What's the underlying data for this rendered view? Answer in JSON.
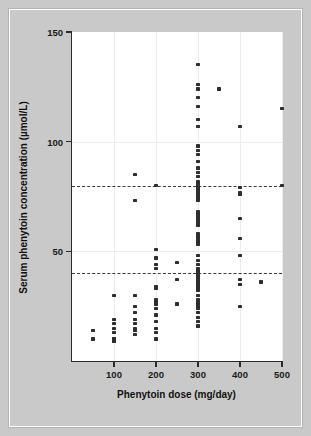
{
  "figure": {
    "background_color": "#c9c9c9",
    "panel_color": "#ffffff",
    "point_color": "#2e2e2e",
    "refline_color": "#3a3a3a",
    "axis_color": "#2b2b2b"
  },
  "chart_data": {
    "type": "scatter",
    "title": "",
    "xlabel": "Phenytoin dose (mg/day)",
    "ylabel": "Serum phenytoin concentration (µmol/L)",
    "xlim": [
      0,
      500
    ],
    "ylim": [
      0,
      150
    ],
    "xticks": [
      100,
      200,
      300,
      400,
      500
    ],
    "xticklabels": [
      "100",
      "200",
      "300",
      "400",
      "500"
    ],
    "yticks": [
      50,
      100,
      150
    ],
    "yticklabels": [
      "50",
      "100",
      "150"
    ],
    "grid": "faint-both",
    "legend": "none",
    "reference_lines": [
      {
        "axis": "y",
        "value": 80,
        "style": "dashed",
        "label": ""
      },
      {
        "axis": "y",
        "value": 40,
        "style": "dashed",
        "label": ""
      }
    ],
    "series": [
      {
        "name": "Patients",
        "marker": "square",
        "points": [
          [
            50,
            14
          ],
          [
            50,
            10
          ],
          [
            100,
            30
          ],
          [
            100,
            19
          ],
          [
            100,
            17
          ],
          [
            100,
            15
          ],
          [
            100,
            13
          ],
          [
            100,
            10
          ],
          [
            100,
            10
          ],
          [
            100,
            9
          ],
          [
            100,
            9
          ],
          [
            150,
            85
          ],
          [
            150,
            73
          ],
          [
            150,
            30
          ],
          [
            150,
            25
          ],
          [
            150,
            22
          ],
          [
            150,
            19
          ],
          [
            150,
            17
          ],
          [
            150,
            15
          ],
          [
            150,
            14
          ],
          [
            150,
            12
          ],
          [
            200,
            80
          ],
          [
            200,
            51
          ],
          [
            200,
            47
          ],
          [
            200,
            44
          ],
          [
            200,
            42
          ],
          [
            200,
            34
          ],
          [
            200,
            33
          ],
          [
            200,
            28
          ],
          [
            200,
            27
          ],
          [
            200,
            27
          ],
          [
            200,
            26
          ],
          [
            200,
            24
          ],
          [
            200,
            21
          ],
          [
            200,
            18
          ],
          [
            200,
            15
          ],
          [
            200,
            13
          ],
          [
            200,
            10
          ],
          [
            250,
            45
          ],
          [
            250,
            37
          ],
          [
            250,
            26
          ],
          [
            300,
            135
          ],
          [
            300,
            126
          ],
          [
            300,
            124
          ],
          [
            300,
            120
          ],
          [
            300,
            116
          ],
          [
            300,
            110
          ],
          [
            300,
            107
          ],
          [
            300,
            98
          ],
          [
            300,
            96
          ],
          [
            300,
            94
          ],
          [
            300,
            91
          ],
          [
            300,
            88
          ],
          [
            300,
            86
          ],
          [
            300,
            84
          ],
          [
            300,
            82
          ],
          [
            300,
            81
          ],
          [
            300,
            80
          ],
          [
            300,
            79
          ],
          [
            300,
            78
          ],
          [
            300,
            77
          ],
          [
            300,
            76
          ],
          [
            300,
            75
          ],
          [
            300,
            75
          ],
          [
            300,
            74
          ],
          [
            300,
            73
          ],
          [
            300,
            68
          ],
          [
            300,
            67
          ],
          [
            300,
            66
          ],
          [
            300,
            65
          ],
          [
            300,
            64
          ],
          [
            300,
            63
          ],
          [
            300,
            62
          ],
          [
            300,
            58
          ],
          [
            300,
            57
          ],
          [
            300,
            56
          ],
          [
            300,
            55
          ],
          [
            300,
            54
          ],
          [
            300,
            53
          ],
          [
            300,
            48
          ],
          [
            300,
            46
          ],
          [
            300,
            44
          ],
          [
            300,
            42
          ],
          [
            300,
            41
          ],
          [
            300,
            40
          ],
          [
            300,
            40
          ],
          [
            300,
            39
          ],
          [
            300,
            38
          ],
          [
            300,
            37
          ],
          [
            300,
            36
          ],
          [
            300,
            36
          ],
          [
            300,
            35
          ],
          [
            300,
            35
          ],
          [
            300,
            34
          ],
          [
            300,
            34
          ],
          [
            300,
            33
          ],
          [
            300,
            33
          ],
          [
            300,
            32
          ],
          [
            300,
            30
          ],
          [
            300,
            28
          ],
          [
            300,
            27
          ],
          [
            300,
            26
          ],
          [
            300,
            26
          ],
          [
            300,
            25
          ],
          [
            300,
            25
          ],
          [
            300,
            24
          ],
          [
            300,
            22
          ],
          [
            300,
            20
          ],
          [
            300,
            18
          ],
          [
            300,
            16
          ],
          [
            350,
            124
          ],
          [
            400,
            107
          ],
          [
            400,
            79
          ],
          [
            400,
            77
          ],
          [
            400,
            76
          ],
          [
            400,
            65
          ],
          [
            400,
            56
          ],
          [
            400,
            48
          ],
          [
            400,
            37
          ],
          [
            400,
            35
          ],
          [
            400,
            25
          ],
          [
            450,
            36
          ],
          [
            500,
            115
          ],
          [
            500,
            80
          ]
        ]
      }
    ]
  }
}
